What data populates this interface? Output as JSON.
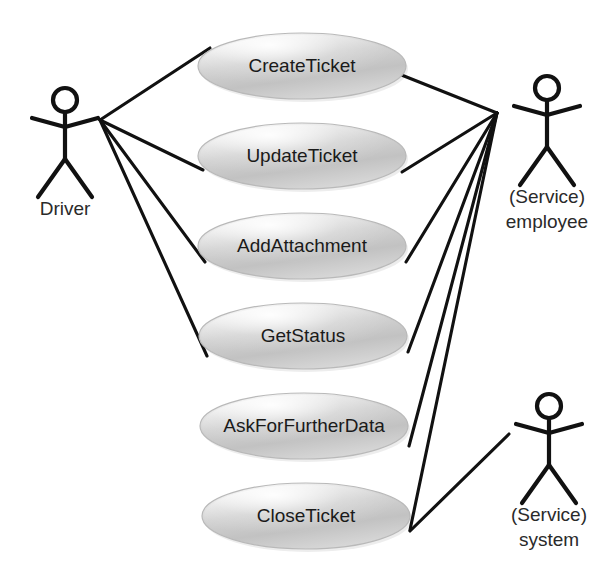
{
  "diagram": {
    "type": "use-case-diagram",
    "canvas": {
      "width": 613,
      "height": 579
    },
    "colors": {
      "line": "#111111",
      "ellipse_fill_light": "#f4f4f4",
      "ellipse_fill_mid": "#c9c9c9",
      "ellipse_fill_dark": "#b0b0b0",
      "ellipse_border": "#b9b9b9",
      "text": "#1a1a1a",
      "background": "#ffffff"
    }
  },
  "use_cases": [
    {
      "id": "create-ticket",
      "label": "CreateTicket",
      "cx": 302,
      "cy": 66,
      "rx": 104,
      "ry": 33
    },
    {
      "id": "update-ticket",
      "label": "UpdateTicket",
      "cx": 302,
      "cy": 156,
      "rx": 104,
      "ry": 33
    },
    {
      "id": "add-attachment",
      "label": "AddAttachment",
      "cx": 302,
      "cy": 246,
      "rx": 104,
      "ry": 33
    },
    {
      "id": "get-status",
      "label": "GetStatus",
      "cx": 303,
      "cy": 336,
      "rx": 104,
      "ry": 33
    },
    {
      "id": "ask-for-further-data",
      "label": "AskForFurtherData",
      "cx": 304,
      "cy": 426,
      "rx": 104,
      "ry": 33
    },
    {
      "id": "close-ticket",
      "label": "CloseTicket",
      "cx": 306,
      "cy": 516,
      "rx": 104,
      "ry": 33
    }
  ],
  "actors": [
    {
      "id": "driver",
      "label_lines": [
        "Driver"
      ],
      "x": 65,
      "head_cy": 100,
      "label_y": 215,
      "hub": {
        "x": 100,
        "y": 120
      }
    },
    {
      "id": "service-employee",
      "label_lines": [
        "(Service)",
        "employee"
      ],
      "x": 547,
      "head_cy": 88,
      "label_y": 203,
      "hub": {
        "x": 497,
        "y": 113
      }
    },
    {
      "id": "service-system",
      "label_lines": [
        "(Service)",
        "system"
      ],
      "x": 549,
      "head_cy": 406,
      "label_y": 521,
      "hub": {
        "x": 509,
        "y": 434
      }
    }
  ],
  "associations": [
    {
      "from": "driver",
      "to": "create-ticket",
      "x1": 100,
      "y1": 120,
      "x2": 210,
      "y2": 48
    },
    {
      "from": "driver",
      "to": "update-ticket",
      "x1": 100,
      "y1": 120,
      "x2": 203,
      "y2": 170
    },
    {
      "from": "driver",
      "to": "add-attachment",
      "x1": 100,
      "y1": 120,
      "x2": 205,
      "y2": 262
    },
    {
      "from": "driver",
      "to": "get-status",
      "x1": 100,
      "y1": 120,
      "x2": 207,
      "y2": 356
    },
    {
      "from": "service-employee",
      "to": "create-ticket",
      "x1": 497,
      "y1": 113,
      "x2": 399,
      "y2": 74
    },
    {
      "from": "service-employee",
      "to": "update-ticket",
      "x1": 497,
      "y1": 113,
      "x2": 402,
      "y2": 172
    },
    {
      "from": "service-employee",
      "to": "add-attachment",
      "x1": 497,
      "y1": 113,
      "x2": 406,
      "y2": 262
    },
    {
      "from": "service-employee",
      "to": "get-status",
      "x1": 497,
      "y1": 113,
      "x2": 408,
      "y2": 352
    },
    {
      "from": "service-employee",
      "to": "ask-for-further-data",
      "x1": 497,
      "y1": 113,
      "x2": 409,
      "y2": 446
    },
    {
      "from": "service-employee",
      "to": "close-ticket",
      "x1": 497,
      "y1": 113,
      "x2": 410,
      "y2": 530
    },
    {
      "from": "service-system",
      "to": "close-ticket",
      "x1": 509,
      "y1": 434,
      "x2": 410,
      "y2": 531
    }
  ]
}
